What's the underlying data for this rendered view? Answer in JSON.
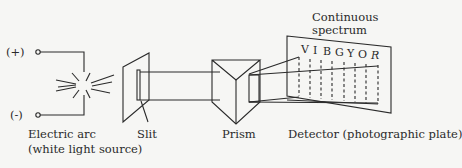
{
  "diagram": {
    "terminals": {
      "positive": "(+)",
      "negative": "(-)"
    },
    "labels": {
      "source_line1": "Electric arc",
      "source_line2": "(white light source)",
      "slit": "Slit",
      "prism": "Prism",
      "detector": "Detector (photographic plate)",
      "spectrum_line1": "Continuous",
      "spectrum_line2": "spectrum"
    },
    "spectrum_letters": [
      "V",
      "I",
      "B",
      "G",
      "Y",
      "O",
      "R"
    ],
    "colors": {
      "line": "#2a2a2a",
      "background": "#f6f6f4"
    }
  }
}
